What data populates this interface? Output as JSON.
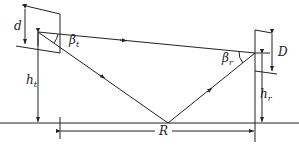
{
  "diagram": {
    "type": "two-ray ground reflection geometry",
    "labels": {
      "d": "d",
      "D": "D",
      "ht_main": "h",
      "ht_sub": "t",
      "hr_main": "h",
      "hr_sub": "r",
      "beta_t_main": "β",
      "beta_t_sub": "t",
      "beta_r_main": "β",
      "beta_r_sub": "r",
      "R": "R"
    },
    "elements": [
      "transmit-antenna-aperture",
      "receive-antenna-aperture",
      "direct-ray",
      "incident-ray",
      "reflected-ray",
      "ground-plane",
      "range-dimension"
    ],
    "colors": {
      "line": "#222222",
      "background": "#ffffff"
    }
  }
}
